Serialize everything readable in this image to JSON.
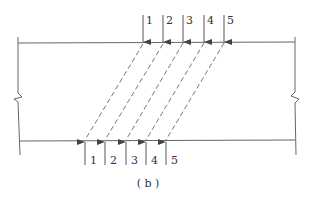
{
  "diagram": {
    "caption": "( b )",
    "colors": {
      "stroke": "#555555",
      "text": "#333333",
      "background": "#ffffff"
    },
    "top_arrows": [
      {
        "label": "1",
        "x": 143
      },
      {
        "label": "2",
        "x": 163
      },
      {
        "label": "3",
        "x": 183
      },
      {
        "label": "4",
        "x": 204
      },
      {
        "label": "5",
        "x": 224
      }
    ],
    "bottom_arrows": [
      {
        "label": "1",
        "x": 85
      },
      {
        "label": "2",
        "x": 105
      },
      {
        "label": "3",
        "x": 126
      },
      {
        "label": "4",
        "x": 146
      },
      {
        "label": "5",
        "x": 166
      }
    ]
  }
}
